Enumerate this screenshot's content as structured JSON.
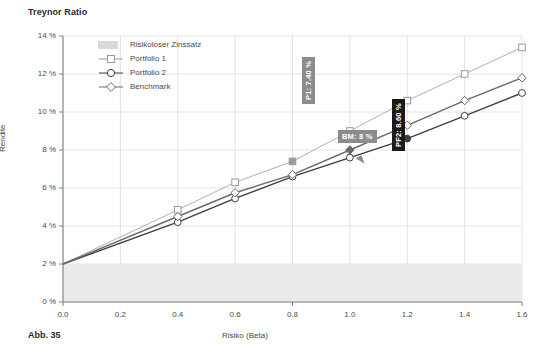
{
  "chart_title": "Treynor Ratio",
  "figure_caption": "Abb. 35",
  "axes": {
    "xlabel": "Risiko (Beta)",
    "ylabel": "Rendite",
    "xticks": [
      "0.0",
      "0.2",
      "0.4",
      "0.6",
      "0.8",
      "1.0",
      "1.2",
      "1.4",
      "1.6"
    ],
    "yticks": [
      "0 %",
      "2 %",
      "4 %",
      "6 %",
      "8 %",
      "10 %",
      "12 %",
      "14 %"
    ]
  },
  "legend": {
    "items": [
      {
        "label": "Risikoloser Zinssatz",
        "marker": "band-swatch",
        "color": "#d9d9d9"
      },
      {
        "label": "Portfolio 1",
        "marker": "square-icon",
        "color": "#9a9a9a"
      },
      {
        "label": "Portfolio 2",
        "marker": "circle-icon",
        "color": "#3f3f3f"
      },
      {
        "label": "Benchmark",
        "marker": "diamond-icon",
        "color": "#6b6b6b"
      }
    ]
  },
  "annotations": [
    {
      "name": "annotation-p1",
      "text": "P1: 7.40 %",
      "style": "grey",
      "orientation": "vertical",
      "x": 302,
      "y": 104
    },
    {
      "name": "annotation-bm",
      "text": "BM: 8 %",
      "style": "grey",
      "orientation": "horizontal",
      "x": 338,
      "y": 130
    },
    {
      "name": "annotation-pf2",
      "text": "PF2: 8.60 %",
      "style": "dark",
      "orientation": "vertical",
      "x": 392,
      "y": 151
    }
  ],
  "colors": {
    "risk_free_band": "#ebebeb",
    "portfolio1": "#9a9a9a",
    "portfolio2": "#3f3f3f",
    "benchmark": "#6b6b6b",
    "grid": "#d7d7d7",
    "axis": "#808080",
    "annotation_grey": "#8c8c8c",
    "annotation_dark": "#1a1a1a"
  },
  "chart_data": {
    "type": "line",
    "title": "Treynor Ratio",
    "xlabel": "Risiko (Beta)",
    "ylabel": "Rendite",
    "xlim": [
      0.0,
      1.6
    ],
    "ylim": [
      0,
      14
    ],
    "grid": true,
    "legend_position": "upper-left-inside",
    "x": [
      0.0,
      0.4,
      0.6,
      0.8,
      1.0,
      1.2,
      1.4,
      1.6
    ],
    "series": [
      {
        "name": "Portfolio 1",
        "marker": "square",
        "color": "#9a9a9a",
        "values": [
          2.0,
          4.85,
          6.3,
          7.4,
          9.0,
          10.6,
          12.0,
          13.4
        ]
      },
      {
        "name": "Portfolio 2",
        "marker": "circle",
        "color": "#3f3f3f",
        "values": [
          2.0,
          4.2,
          5.45,
          6.6,
          7.6,
          8.6,
          9.8,
          11.0
        ]
      },
      {
        "name": "Benchmark",
        "marker": "diamond",
        "color": "#6b6b6b",
        "values": [
          2.0,
          4.5,
          5.75,
          6.7,
          8.0,
          9.3,
          10.6,
          11.8
        ]
      }
    ],
    "risk_free_band": {
      "from": 0.0,
      "to": 2.0,
      "label": "Risikoloser Zinssatz"
    },
    "highlights": [
      {
        "series": "Portfolio 1",
        "x": 0.8,
        "y": 7.4,
        "label": "P1: 7.40 %"
      },
      {
        "series": "Benchmark",
        "x": 1.0,
        "y": 8.0,
        "label": "BM: 8 %"
      },
      {
        "series": "Portfolio 2",
        "x": 1.2,
        "y": 8.6,
        "label": "PF2: 8.60 %"
      }
    ]
  }
}
